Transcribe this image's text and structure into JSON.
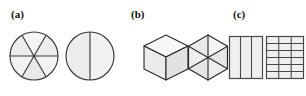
{
  "figure": {
    "width": 306,
    "height": 96,
    "background": "#ffffff",
    "stroke_color": "#2b2b2b",
    "fill_color": "#ebebeb",
    "fill_color_light": "#f4f4f4",
    "label_color": "#111111"
  },
  "panels": [
    {
      "id": "a",
      "label": "(a)",
      "shapes": [
        {
          "name": "circle-six-sectors",
          "type": "circle",
          "divisions": 6,
          "division_style": "three-diameters",
          "description": "Circle divided into six equal sectors by three diameters"
        },
        {
          "name": "circle-two-halves",
          "type": "circle",
          "divisions": 2,
          "division_style": "vertical-diameter",
          "description": "Circle divided into two equal halves by a vertical diameter"
        }
      ]
    },
    {
      "id": "b",
      "label": "(b)",
      "shapes": [
        {
          "name": "isometric-cube",
          "type": "cube",
          "divisions": 3,
          "division_style": "three-visible-faces",
          "description": "Isometric cube showing three visible rhombic faces"
        },
        {
          "name": "hexagon-six-triangles",
          "type": "hexagon",
          "divisions": 6,
          "division_style": "three-long-diagonals",
          "description": "Regular hexagon divided into six triangles from the centre"
        }
      ]
    },
    {
      "id": "c",
      "label": "(c)",
      "shapes": [
        {
          "name": "rectangle-three-columns",
          "type": "rectangle",
          "columns": 3,
          "rows": 1,
          "description": "Rectangle divided into three vertical columns"
        },
        {
          "name": "rectangle-grid",
          "type": "rectangle",
          "columns": 3,
          "rows": 6,
          "description": "Rectangle divided into a grid of three columns by six rows"
        }
      ]
    }
  ]
}
